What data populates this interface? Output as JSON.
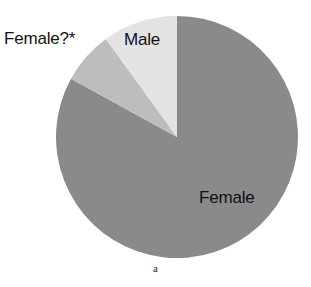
{
  "figure": {
    "caption": "a",
    "background_color": "#ffffff"
  },
  "labels": {
    "female_questionable": "Female?*",
    "male": "Male",
    "female": "Female"
  },
  "chart_data": {
    "type": "pie",
    "title": "",
    "subtitle": "",
    "xlabel": "",
    "ylabel": "",
    "legend_position": "none",
    "grid": false,
    "annotations": [
      "a"
    ],
    "center": {
      "x": 177,
      "y": 137
    },
    "radius": 121,
    "start_angle_deg": 0,
    "direction": "clockwise",
    "categories": [
      "Female",
      "Female?*",
      "Male"
    ],
    "values": [
      83,
      7,
      10
    ],
    "value_unit": "percent",
    "colors": [
      "#8a8a8a",
      "#bdbdbd",
      "#e3e3e3"
    ],
    "slices": [
      {
        "label": "Female",
        "value": 83,
        "color": "#8a8a8a",
        "start_angle_deg": 0,
        "end_angle_deg": 298.8,
        "label_position": "inside"
      },
      {
        "label": "Female?*",
        "value": 7,
        "color": "#bdbdbd",
        "start_angle_deg": 298.8,
        "end_angle_deg": 324.0,
        "label_position": "outside-left"
      },
      {
        "label": "Male",
        "value": 10,
        "color": "#e3e3e3",
        "start_angle_deg": 324.0,
        "end_angle_deg": 360.0,
        "label_position": "inside-top"
      }
    ]
  }
}
